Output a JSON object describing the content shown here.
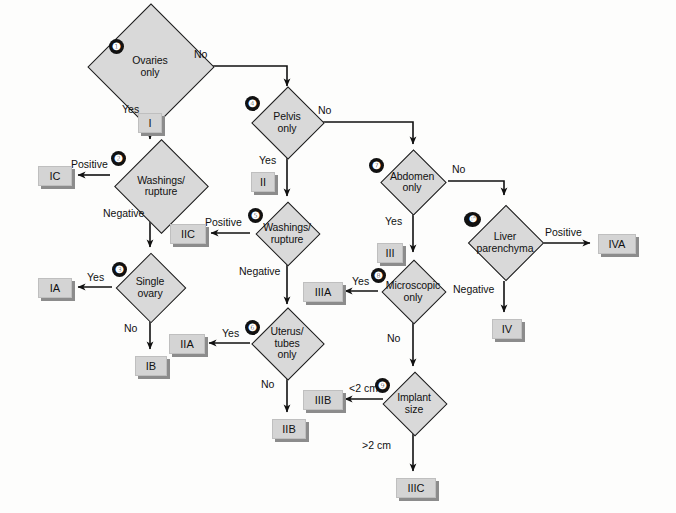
{
  "diagram": {
    "colors": {
      "diamond_fill": "#d9d9d9",
      "stage_fill": "#d4d4d4",
      "stage_shadow": "#8c8c8c",
      "stroke": "#1a1a1a",
      "background": "#fdfdfc",
      "bullet_fill": "#111111"
    },
    "nodes": [
      {
        "id": "n1",
        "number": "❶",
        "label_line1": "Ovaries",
        "label_line2": "only"
      },
      {
        "id": "n2",
        "number": "❷",
        "label_line1": "Washings/",
        "label_line2": "rupture"
      },
      {
        "id": "n3",
        "number": "❸",
        "label_line1": "Single",
        "label_line2": "ovary"
      },
      {
        "id": "n4",
        "number": "❹",
        "label_line1": "Pelvis",
        "label_line2": "only"
      },
      {
        "id": "n5",
        "number": "❺",
        "label_line1": "Washings/",
        "label_line2": "rupture"
      },
      {
        "id": "n6",
        "number": "❻",
        "label_line1": "Uterus/",
        "label_line2": "tubes",
        "label_line3": "only"
      },
      {
        "id": "n7",
        "number": "❼",
        "label_line1": "Abdomen",
        "label_line2": "only"
      },
      {
        "id": "n8",
        "number": "❽",
        "label_line1": "Microscopic",
        "label_line2": "only"
      },
      {
        "id": "n9",
        "number": "❾",
        "label_line1": "Implant",
        "label_line2": "size"
      },
      {
        "id": "n10",
        "number": "❿",
        "label_line1": "Liver",
        "label_line2": "parenchyma"
      }
    ],
    "stages": [
      {
        "id": "s_I",
        "text": "I"
      },
      {
        "id": "s_IC",
        "text": "IC"
      },
      {
        "id": "s_IA",
        "text": "IA"
      },
      {
        "id": "s_IB",
        "text": "IB"
      },
      {
        "id": "s_II",
        "text": "II"
      },
      {
        "id": "s_IIC",
        "text": "IIC"
      },
      {
        "id": "s_IIA",
        "text": "IIA"
      },
      {
        "id": "s_IIB",
        "text": "IIB"
      },
      {
        "id": "s_III",
        "text": "III"
      },
      {
        "id": "s_IIIA",
        "text": "IIIA"
      },
      {
        "id": "s_IIIB",
        "text": "IIIB"
      },
      {
        "id": "s_IIIC",
        "text": "IIIC"
      },
      {
        "id": "s_IVA",
        "text": "IVA"
      },
      {
        "id": "s_IV",
        "text": "IV"
      }
    ],
    "edge_labels": [
      {
        "id": "e1_no",
        "text": "No",
        "from": "n1",
        "to": "n4"
      },
      {
        "id": "e1_yes",
        "text": "Yes",
        "from": "n1",
        "to": "n2"
      },
      {
        "id": "e2_pos",
        "text": "Positive",
        "from": "n2",
        "to": "s_IC"
      },
      {
        "id": "e2_neg",
        "text": "Negative",
        "from": "n2",
        "to": "n3"
      },
      {
        "id": "e3_yes",
        "text": "Yes",
        "from": "n3",
        "to": "s_IA"
      },
      {
        "id": "e3_no",
        "text": "No",
        "from": "n3",
        "to": "s_IB"
      },
      {
        "id": "e4_no",
        "text": "No",
        "from": "n4",
        "to": "n7"
      },
      {
        "id": "e4_yes",
        "text": "Yes",
        "from": "n4",
        "to": "n5"
      },
      {
        "id": "e5_pos",
        "text": "Positive",
        "from": "n5",
        "to": "s_IIC"
      },
      {
        "id": "e5_neg",
        "text": "Negative",
        "from": "n5",
        "to": "n6"
      },
      {
        "id": "e6_yes",
        "text": "Yes",
        "from": "n6",
        "to": "s_IIA"
      },
      {
        "id": "e6_no",
        "text": "No",
        "from": "n6",
        "to": "s_IIB"
      },
      {
        "id": "e7_no",
        "text": "No",
        "from": "n7",
        "to": "n10"
      },
      {
        "id": "e7_yes",
        "text": "Yes",
        "from": "n7",
        "to": "n8"
      },
      {
        "id": "e8_yes",
        "text": "Yes",
        "from": "n8",
        "to": "s_IIIA"
      },
      {
        "id": "e8_no",
        "text": "No",
        "from": "n8",
        "to": "n9"
      },
      {
        "id": "e9_lt",
        "text": "<2 cm",
        "from": "n9",
        "to": "s_IIIB"
      },
      {
        "id": "e9_gt",
        "text": ">2 cm",
        "from": "n9",
        "to": "s_IIIC"
      },
      {
        "id": "e10_pos",
        "text": "Positive",
        "from": "n10",
        "to": "s_IVA"
      },
      {
        "id": "e10_neg",
        "text": "Negative",
        "from": "n10",
        "to": "s_IV"
      }
    ]
  }
}
